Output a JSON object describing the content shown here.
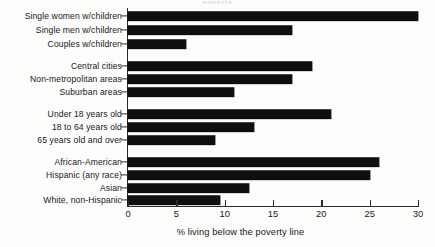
{
  "figure": {
    "top_crop_text": "poverty",
    "axis_title": "% living below the poverty line"
  },
  "axis": {
    "ticks": [
      {
        "value": 0,
        "label": "0"
      },
      {
        "value": 5,
        "label": "5"
      },
      {
        "value": 10,
        "label": "10"
      },
      {
        "value": 15,
        "label": "15"
      },
      {
        "value": 20,
        "label": "20"
      },
      {
        "value": 25,
        "label": "25"
      },
      {
        "value": 30,
        "label": "30"
      }
    ]
  },
  "chart_data": {
    "type": "bar",
    "orientation": "horizontal",
    "title": "",
    "xlabel": "% living below the poverty line",
    "ylabel": "",
    "xlim": [
      0,
      30
    ],
    "xticks": [
      0,
      5,
      10,
      15,
      20,
      25,
      30
    ],
    "grid": false,
    "legend": null,
    "bar_color": "#100f0d",
    "groups": [
      {
        "name": "Family type",
        "categories": [
          "Single women w/children",
          "Single men w/children",
          "Couples w/children"
        ],
        "values": [
          30,
          17,
          6
        ]
      },
      {
        "name": "Location",
        "categories": [
          "Central cities",
          "Non-metropolitan areas",
          "Suburban areas"
        ],
        "values": [
          19,
          17,
          11
        ]
      },
      {
        "name": "Age",
        "categories": [
          "Under 18 years old",
          "18 to 64 years old",
          "65 years old and over"
        ],
        "values": [
          21,
          13,
          9
        ]
      },
      {
        "name": "Race/ethnicity",
        "categories": [
          "African-American",
          "Hispanic (any race)",
          "Asian",
          "White, non-Hispanic"
        ],
        "values": [
          26,
          25,
          12.5,
          9.5
        ]
      }
    ],
    "categories": [
      "Single women w/children",
      "Single men w/children",
      "Couples w/children",
      "Central cities",
      "Non-metropolitan areas",
      "Suburban areas",
      "Under 18 years old",
      "18 to 64 years old",
      "65 years old and over",
      "African-American",
      "Hispanic (any race)",
      "Asian",
      "White, non-Hispanic"
    ],
    "values": [
      30,
      17,
      6,
      19,
      17,
      11,
      21,
      13,
      9,
      26,
      25,
      12.5,
      9.5
    ]
  },
  "rows": [
    {
      "label": "Single women w/children",
      "value": 30,
      "y": 16
    },
    {
      "label": "Single men w/children",
      "value": 17,
      "y": 30
    },
    {
      "label": "Couples w/children",
      "value": 6,
      "y": 44
    },
    {
      "label": "Central cities",
      "value": 19,
      "y": 66
    },
    {
      "label": "Non-metropolitan areas",
      "value": 17,
      "y": 79
    },
    {
      "label": "Suburban areas",
      "value": 11,
      "y": 92
    },
    {
      "label": "Under 18 years old",
      "value": 21,
      "y": 114
    },
    {
      "label": "18 to 64 years old",
      "value": 13,
      "y": 127
    },
    {
      "label": "65 years old and over",
      "value": 9,
      "y": 140
    },
    {
      "label": "African-American",
      "value": 26,
      "y": 162
    },
    {
      "label": "Hispanic (any race)",
      "value": 25,
      "y": 175
    },
    {
      "label": "Asian",
      "value": 12.5,
      "y": 188
    },
    {
      "label": "White, non-Hispanic",
      "value": 9.5,
      "y": 200
    }
  ]
}
